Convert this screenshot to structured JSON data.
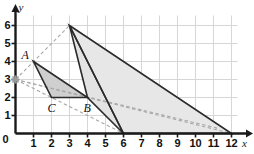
{
  "figure": {
    "kind": "coordinate-plane-dilation",
    "axes": {
      "x_label": "x",
      "y_label": "y",
      "origin_label": "0",
      "x_ticks": [
        "1",
        "2",
        "3",
        "4",
        "5",
        "6",
        "7",
        "8",
        "9",
        "10",
        "11",
        "12"
      ],
      "y_ticks": [
        "1",
        "2",
        "3",
        "4",
        "5",
        "6"
      ],
      "xlim": [
        0,
        12
      ],
      "ylim": [
        0,
        6
      ],
      "grid": true
    },
    "colors": {
      "grid": "#d6d6d6",
      "axis": "#1a1a1a",
      "outline": "#2b2b2b",
      "fill_light": "#e7e7e7",
      "fill_dark": "#cfcfcf",
      "dashed": "#a8a8a8",
      "center_marker": "#9a9a9a"
    },
    "center_of_dilation": {
      "x": 0,
      "y": 3
    },
    "shapes": [
      {
        "name": "triangle-abc",
        "vertices": [
          [
            1,
            4
          ],
          [
            4,
            2
          ],
          [
            2,
            2
          ]
        ],
        "fill": "#cfcfcf",
        "labels": [
          "A",
          "B",
          "C"
        ]
      },
      {
        "name": "triangle-image-medium",
        "vertices": [
          [
            3,
            6
          ],
          [
            6,
            0
          ],
          [
            4,
            2
          ]
        ],
        "fill": "#e3e3e3"
      },
      {
        "name": "triangle-image-large",
        "vertices": [
          [
            3,
            6
          ],
          [
            12,
            0
          ],
          [
            6,
            0
          ]
        ],
        "fill": "#e7e7e7"
      }
    ],
    "dashed_rays": [
      {
        "name": "ray-through-a",
        "from": [
          0,
          3
        ],
        "to": [
          3,
          6
        ]
      },
      {
        "name": "ray-through-c",
        "from": [
          0,
          3
        ],
        "to": [
          6,
          0
        ]
      },
      {
        "name": "ray-through-b",
        "from": [
          0,
          3
        ],
        "to": [
          12,
          0
        ]
      },
      {
        "name": "ray-b-extension",
        "from": [
          0,
          3
        ],
        "to": [
          11.2,
          0.3
        ]
      }
    ],
    "point_labels": [
      {
        "name": "label-a",
        "text": "A",
        "x": 1,
        "y": 4
      },
      {
        "name": "label-b",
        "text": "B",
        "x": 4,
        "y": 2
      },
      {
        "name": "label-c",
        "text": "C",
        "x": 2,
        "y": 2
      }
    ]
  }
}
